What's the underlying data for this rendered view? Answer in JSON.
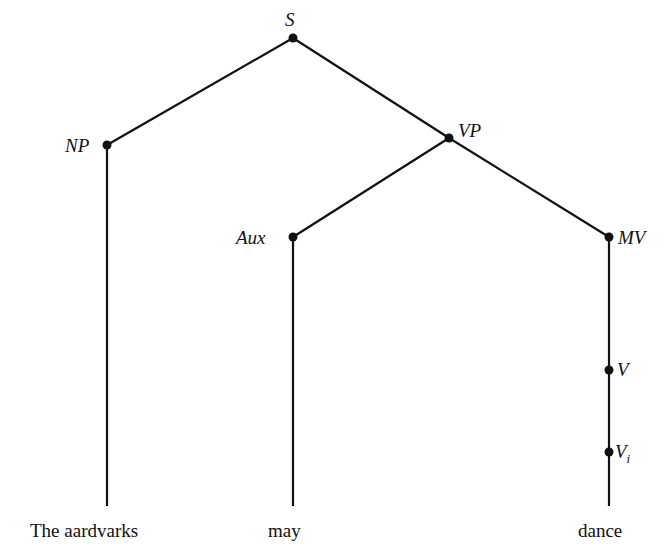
{
  "diagram": {
    "type": "syntax-tree",
    "nodes": [
      {
        "id": "S",
        "label": "S",
        "sub": ""
      },
      {
        "id": "NP",
        "label": "NP",
        "sub": ""
      },
      {
        "id": "VP",
        "label": "VP",
        "sub": ""
      },
      {
        "id": "Aux",
        "label": "Aux",
        "sub": ""
      },
      {
        "id": "MV",
        "label": "MV",
        "sub": ""
      },
      {
        "id": "V",
        "label": "V",
        "sub": ""
      },
      {
        "id": "Vi",
        "label": "V",
        "sub": "i"
      }
    ],
    "edges": [
      [
        "S",
        "NP"
      ],
      [
        "S",
        "VP"
      ],
      [
        "VP",
        "Aux"
      ],
      [
        "VP",
        "MV"
      ],
      [
        "MV",
        "V"
      ],
      [
        "V",
        "Vi"
      ],
      [
        "NP",
        "The aardvarks"
      ],
      [
        "Aux",
        "may"
      ],
      [
        "Vi",
        "dance"
      ]
    ],
    "words": [
      "The aardvarks",
      "may",
      "dance"
    ]
  }
}
